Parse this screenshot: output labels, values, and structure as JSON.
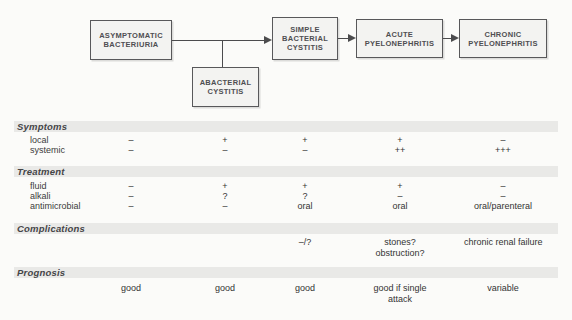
{
  "figure": {
    "type": "flowchart-with-table",
    "topic": "urinary tract infection conditions"
  },
  "flowchart": {
    "boxes": [
      {
        "id": "asymptomatic-bacteriuria",
        "label": "ASYMPTOMATIC\nBACTERIURIA"
      },
      {
        "id": "abacterial-cystitis",
        "label": "ABACTERIAL\nCYSTITIS"
      },
      {
        "id": "simple-bacterial-cystitis",
        "label": "SIMPLE\nBACTERIAL\nCYSTITIS"
      },
      {
        "id": "acute-pyelonephritis",
        "label": "ACUTE\nPYELONEPHRITIS"
      },
      {
        "id": "chronic-pyelonephritis",
        "label": "CHRONIC\nPYELONEPHRITIS"
      }
    ],
    "connections": [
      {
        "from": "asymptomatic-bacteriuria",
        "to": "simple-bacterial-cystitis",
        "arrow": true
      },
      {
        "from": "abacterial-cystitis",
        "to": "simple-bacterial-cystitis",
        "arrow": true,
        "via": "branch"
      },
      {
        "from": "simple-bacterial-cystitis",
        "to": "acute-pyelonephritis",
        "arrow": true
      },
      {
        "from": "acute-pyelonephritis",
        "to": "chronic-pyelonephritis",
        "arrow": true
      }
    ]
  },
  "table": {
    "columns": [
      "asymptomatic bacteriuria",
      "abacterial cystitis",
      "simple bacterial cystitis",
      "acute pyelonephritis",
      "chronic pyelonephritis"
    ],
    "sections": [
      {
        "title": "Symptoms",
        "rows": [
          {
            "label": "local",
            "values": [
              "–",
              "+",
              "+",
              "+",
              "–"
            ]
          },
          {
            "label": "systemic",
            "values": [
              "–",
              "–",
              "–",
              "++",
              "+++"
            ]
          }
        ]
      },
      {
        "title": "Treatment",
        "rows": [
          {
            "label": "fluid",
            "values": [
              "–",
              "+",
              "+",
              "+",
              "–"
            ]
          },
          {
            "label": "alkali",
            "values": [
              "–",
              "?",
              "?",
              "–",
              "–"
            ]
          },
          {
            "label": "antimicrobial",
            "values": [
              "–",
              "–",
              "oral",
              "oral",
              "oral/parenteral"
            ]
          }
        ]
      },
      {
        "title": "Complications",
        "rows": [
          {
            "label": "",
            "values": [
              "",
              "",
              "–/?",
              "stones?\nobstruction?",
              "chronic renal failure"
            ]
          }
        ]
      },
      {
        "title": "Prognosis",
        "rows": [
          {
            "label": "",
            "values": [
              "good",
              "good",
              "good",
              "good if single\nattack",
              "variable"
            ]
          }
        ]
      }
    ]
  },
  "colors": {
    "background": "#fbfbf9",
    "band_bg": "#e9e9e7",
    "box_bg": "#f3f3f1",
    "box_border": "#58585a",
    "line": "#4c4c4e",
    "text": "#3c3c3c"
  }
}
